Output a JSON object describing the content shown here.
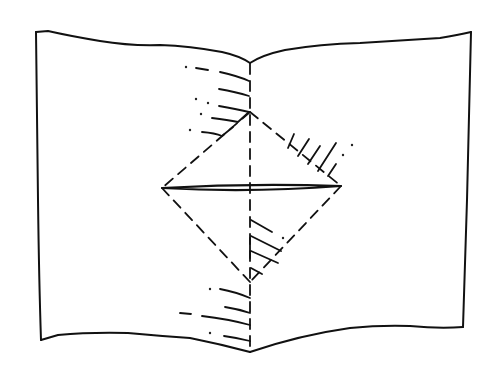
{
  "diagram": {
    "type": "hand-drawn sketch",
    "subject": "open sheet folded along center spine with diamond-shaped pop-up cut",
    "text_labels": [],
    "ink_color": "#111111",
    "background_color": "#ffffff",
    "elements": {
      "left_page": {
        "corners": [
          [
            36,
            31
          ],
          [
            250,
            62
          ],
          [
            250,
            352
          ],
          [
            41,
            340
          ]
        ]
      },
      "right_page": {
        "corners": [
          [
            250,
            62
          ],
          [
            471,
            32
          ],
          [
            463,
            327
          ],
          [
            250,
            352
          ]
        ]
      },
      "spine_fold": {
        "style": "dashed",
        "x": 250,
        "y_range": [
          62,
          352
        ]
      },
      "diamond_fold": {
        "style": "dashed",
        "top": [
          250,
          112
        ],
        "left": [
          162,
          188
        ],
        "right": [
          341,
          186
        ],
        "bottom": [
          250,
          282
        ]
      },
      "center_slit": {
        "style": "solid double",
        "from": [
          162,
          188
        ],
        "to": [
          341,
          186
        ]
      },
      "hatching_groups": [
        "upper-left spine",
        "upper-right diamond edge",
        "lower-left diamond interior",
        "lower-left spine"
      ]
    }
  }
}
